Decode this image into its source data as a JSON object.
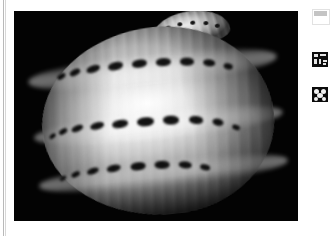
{
  "page": {
    "background_color": "#ffffff",
    "left_rule_color": "#b9b9b9"
  },
  "image_panel": {
    "name": "shell-photograph",
    "background_color": "#000000",
    "caption": "",
    "subject": "grayscale photograph of a banded sea snail shell",
    "description": "Glossy spiral shell photographed against a black background, showing three rows of dark rectangular dashes spiralling around a pale ribbed body whorl, with a small spired apex at the top."
  },
  "sidebar": {
    "icons": [
      {
        "name": "document-thumbnail-icon",
        "label": "",
        "color": "#c4c4c4"
      },
      {
        "name": "text-thumbnail-icon",
        "label": "",
        "color": "#0d0d0d"
      },
      {
        "name": "figure-thumbnail-icon",
        "label": "",
        "color": "#0b0b0b"
      }
    ]
  }
}
